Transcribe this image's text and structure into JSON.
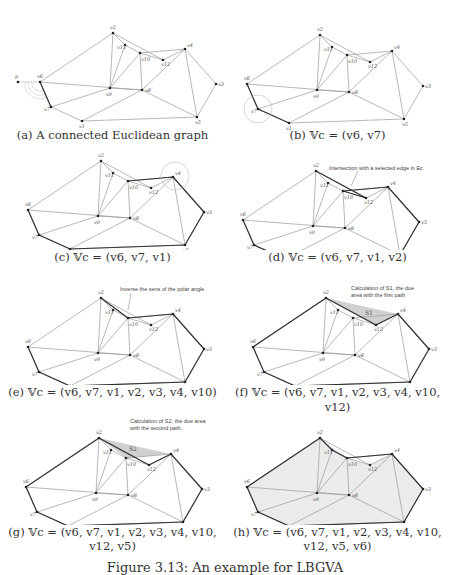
{
  "figure": {
    "caption": "Figure 3.13: An example for LBGVA",
    "panels": [
      {
        "id": "a",
        "caption": "(a) A connected Euclidean graph",
        "annotation": ""
      },
      {
        "id": "b",
        "caption": "(b) 𝕍c = (v6, v7)",
        "annotation": ""
      },
      {
        "id": "c",
        "caption": "(c) 𝕍c = (v6, v7, v1)",
        "annotation": "Intersection with a selected edge in Ec"
      },
      {
        "id": "d",
        "caption": "(d) 𝕍c = (v6, v7, v1, v2)",
        "annotation": "Inverse the sens of the polar angle"
      },
      {
        "id": "e",
        "caption": "(e) 𝕍c = (v6, v7, v1, v2, v3, v4, v10)",
        "annotation": "Calculation of S1, the due area with the first path"
      },
      {
        "id": "f",
        "caption": "(f) 𝕍c = (v6, v7, v1, v2, v3, v4, v10, v12)",
        "annotation": ""
      },
      {
        "id": "g",
        "caption_line1": "(g) 𝕍c = (v6, v7, v1, v2, v3, v4, v10,",
        "caption_line2": "v12, v5)",
        "annotation": "Calculation of S2, the due area with the second path."
      },
      {
        "id": "h",
        "caption_line1": "(h) 𝕍c = (v6, v7, v1, v2, v3, v4, v10,",
        "caption_line2": "v12, v5, v6)",
        "annotation": ""
      }
    ],
    "area_labels": {
      "s1": "S1",
      "s2": "S2"
    },
    "start_point_label": "p",
    "vertex_labels": {
      "v1": "v1",
      "v2": "v2",
      "v3": "v3",
      "v4": "v4",
      "v5": "v5",
      "v6": "v6",
      "v7": "v7",
      "v8": "v8",
      "v9": "v9",
      "v10": "v10",
      "v11": "v11",
      "v12": "v12"
    }
  }
}
